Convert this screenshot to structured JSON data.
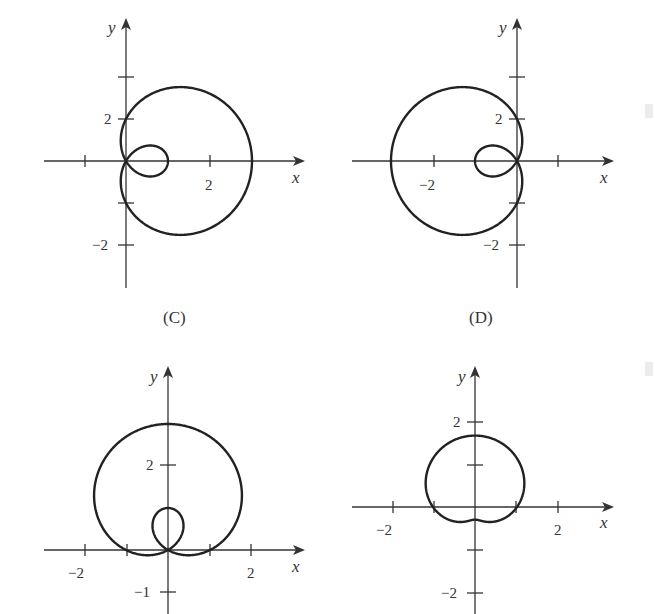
{
  "chart_data": [
    {
      "type": "line",
      "panel": "top-left",
      "caption": "(C)",
      "title": "",
      "xlabel": "x",
      "ylabel": "y",
      "equation_hint": "limaçon with inner loop opening right",
      "x_tick_labels": [
        "2"
      ],
      "y_tick_labels": [
        "2",
        "−2"
      ],
      "x_ticks": [
        -1,
        2
      ],
      "y_ticks": [
        3,
        2,
        -1,
        -2
      ],
      "curve": {
        "kind": "polar",
        "a": 1,
        "b": 2,
        "trig": "cos",
        "sign": 1
      },
      "xlim": [
        -2,
        4
      ],
      "ylim": [
        -3,
        3.5
      ],
      "grid": false
    },
    {
      "type": "line",
      "panel": "top-right",
      "caption": "(D)",
      "title": "",
      "xlabel": "x",
      "ylabel": "y",
      "equation_hint": "limaçon with inner loop opening left",
      "x_tick_labels": [
        "−2"
      ],
      "y_tick_labels": [
        "2",
        "−2"
      ],
      "x_ticks": [
        -2,
        1
      ],
      "y_ticks": [
        3,
        2,
        -1,
        -2
      ],
      "curve": {
        "kind": "polar",
        "a": 1,
        "b": 2,
        "trig": "cos",
        "sign": -1
      },
      "xlim": [
        -3,
        2
      ],
      "ylim": [
        -3,
        3.5
      ],
      "grid": false
    },
    {
      "type": "line",
      "panel": "bottom-left",
      "caption": "",
      "title": "",
      "xlabel": "x",
      "ylabel": "y",
      "equation_hint": "limaçon with inner loop opening up",
      "x_tick_labels": [
        "−2",
        "2"
      ],
      "y_tick_labels": [
        "2",
        "−1"
      ],
      "x_ticks": [
        -2,
        -1,
        1,
        2
      ],
      "y_ticks": [
        2,
        -1
      ],
      "curve": {
        "kind": "polar",
        "a": 1,
        "b": 2,
        "trig": "sin",
        "sign": 1
      },
      "xlim": [
        -3,
        3
      ],
      "ylim": [
        -1.5,
        4
      ],
      "grid": false
    },
    {
      "type": "line",
      "panel": "bottom-right",
      "caption": "",
      "title": "",
      "xlabel": "x",
      "ylabel": "y",
      "equation_hint": "dimpled limaçon opening up",
      "x_tick_labels": [
        "−2",
        "2"
      ],
      "y_tick_labels": [
        "2",
        "−2"
      ],
      "x_ticks": [
        -2,
        -1,
        1,
        2
      ],
      "y_ticks": [
        2,
        1,
        -1,
        -2
      ],
      "curve": {
        "kind": "polar",
        "a": 1,
        "b": 0.7,
        "trig": "sin",
        "sign": 1
      },
      "xlim": [
        -3,
        3
      ],
      "ylim": [
        -2.5,
        3
      ],
      "grid": false
    }
  ],
  "panels": {
    "c": {
      "caption": "(C)",
      "xlabel": "x",
      "ylabel": "y",
      "xt2": "2",
      "yt2": "2",
      "ytm2": "−2"
    },
    "d": {
      "caption": "(D)",
      "xlabel": "x",
      "ylabel": "y",
      "xtm2": "−2",
      "yt2": "2",
      "ytm2": "−2"
    },
    "e": {
      "xlabel": "x",
      "ylabel": "y",
      "xtm2": "−2",
      "xt2": "2",
      "yt2": "2",
      "ytm1": "−1"
    },
    "f": {
      "xlabel": "x",
      "ylabel": "y",
      "xtm2": "−2",
      "xt2": "2",
      "yt2": "2",
      "ytm2": "−2"
    }
  }
}
